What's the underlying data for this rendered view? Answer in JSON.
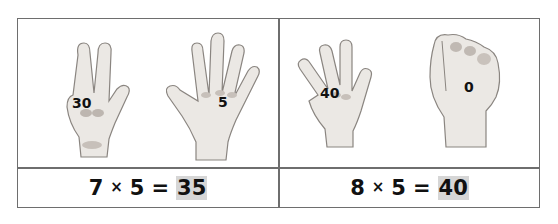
{
  "worksheet": {
    "cells": [
      {
        "hands": [
          {
            "gesture": "three-fingers-up",
            "label": "30"
          },
          {
            "gesture": "open-palm-five",
            "label": "5"
          }
        ],
        "equation": {
          "a": "7",
          "op": "×",
          "b": "5",
          "eq": "=",
          "answer": "35"
        }
      },
      {
        "hands": [
          {
            "gesture": "four-fingers-up",
            "label": "40"
          },
          {
            "gesture": "closed-fist",
            "label": "0"
          }
        ],
        "equation": {
          "a": "8",
          "op": "×",
          "b": "5",
          "eq": "=",
          "answer": "40"
        }
      }
    ],
    "colors": {
      "border": "#6e6e6e",
      "answer_highlight": "#d6d6d6",
      "skin": "#e9e6e2",
      "shade": "#b9b3ae"
    }
  }
}
